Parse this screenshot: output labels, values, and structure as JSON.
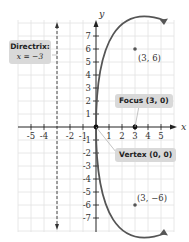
{
  "diagram": {
    "type": "parabola-graph",
    "equation_hint": "y^2 = 12x",
    "axes": {
      "x_label": "x",
      "y_label": "y",
      "x_ticks": [
        "-5",
        "-4",
        "-2",
        "-1",
        "1",
        "2",
        "3",
        "4",
        "5"
      ],
      "y_ticks_positive": [
        "1",
        "2",
        "3",
        "4",
        "5",
        "6",
        "7"
      ],
      "y_ticks_negative": [
        "-1",
        "-2",
        "-3",
        "-4",
        "-5",
        "-6",
        "-7"
      ],
      "x_range": [
        -6,
        6
      ],
      "y_range": [
        -8,
        8
      ]
    },
    "points": [
      {
        "label": "(3, 6)",
        "x": 3,
        "y": 6
      },
      {
        "label": "(3, −6)",
        "x": 3,
        "y": -6
      }
    ],
    "focus": {
      "label": "Focus (3, 0)",
      "x": 3,
      "y": 0
    },
    "vertex": {
      "label": "Vertex (0, 0)",
      "x": 0,
      "y": 0
    },
    "directrix": {
      "title": "Directrix:",
      "equation": "x = −3",
      "x": -3
    },
    "colors": {
      "curve": "#555555",
      "grid": "#e2e2e2",
      "axis": "#222222",
      "callout_bg": "#d9d9d9"
    }
  }
}
